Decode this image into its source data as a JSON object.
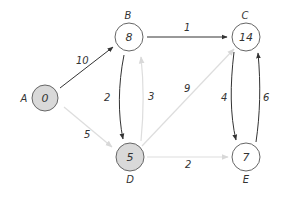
{
  "colors": {
    "node_stroke": "#666666",
    "visited_fill": "#d9d9d9",
    "unvisited_fill": "#ffffff",
    "active_edge": "#333333",
    "faint_edge": "#dddddd",
    "text": "#333333"
  },
  "nodes": [
    {
      "id": "A",
      "name": "A",
      "value": "0",
      "shaded": true
    },
    {
      "id": "B",
      "name": "B",
      "value": "8",
      "shaded": false
    },
    {
      "id": "C",
      "name": "C",
      "value": "14",
      "shaded": false
    },
    {
      "id": "D",
      "name": "D",
      "value": "5",
      "shaded": true
    },
    {
      "id": "E",
      "name": "E",
      "value": "7",
      "shaded": false
    }
  ],
  "edges": [
    {
      "from": "A",
      "to": "B",
      "weight": "10",
      "highlighted": true
    },
    {
      "from": "B",
      "to": "C",
      "weight": "1",
      "highlighted": true
    },
    {
      "from": "B",
      "to": "D",
      "weight": "2",
      "highlighted": true
    },
    {
      "from": "D",
      "to": "B",
      "weight": "3",
      "highlighted": false
    },
    {
      "from": "A",
      "to": "D",
      "weight": "5",
      "highlighted": false
    },
    {
      "from": "D",
      "to": "C",
      "weight": "9",
      "highlighted": false
    },
    {
      "from": "D",
      "to": "E",
      "weight": "2",
      "highlighted": false
    },
    {
      "from": "C",
      "to": "E",
      "weight": "4",
      "highlighted": true
    },
    {
      "from": "E",
      "to": "C",
      "weight": "6",
      "highlighted": true
    }
  ]
}
